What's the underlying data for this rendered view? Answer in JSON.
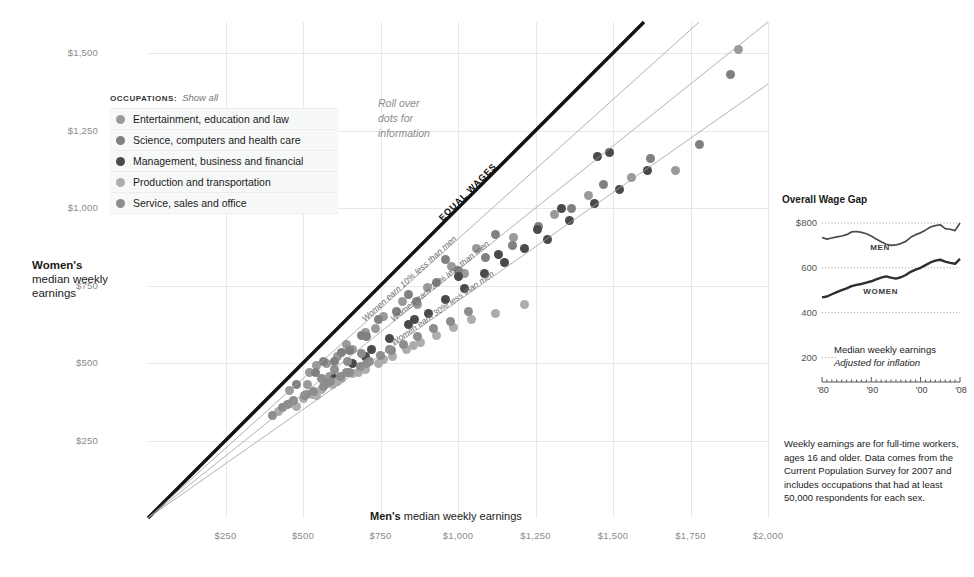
{
  "chart_data": {
    "type": "scatter",
    "title": "",
    "xlabel": "Men's median weekly earnings",
    "ylabel": "Women's median weekly earnings",
    "xlim": [
      0,
      2000
    ],
    "ylim": [
      0,
      1600
    ],
    "grid": true,
    "xticks": [
      "$250",
      "$500",
      "$750",
      "$1,000",
      "$1,250",
      "$1,500",
      "$1,750",
      "$2,000"
    ],
    "xtick_values": [
      250,
      500,
      750,
      1000,
      1250,
      1500,
      1750,
      2000
    ],
    "yticks": [
      "$1,500",
      "$1,250",
      "$1,000",
      "$750",
      "$500",
      "$250"
    ],
    "ytick_values": [
      1500,
      1250,
      1000,
      750,
      500,
      250
    ],
    "reference_lines": [
      {
        "label": "EQUAL WAGES",
        "ratio": 1.0,
        "style": "thick-black"
      },
      {
        "label": "Women earn 10% less than men",
        "ratio": 0.9,
        "style": "thin-gray"
      },
      {
        "label": "Women earn 20% less than men",
        "ratio": 0.8,
        "style": "thin-gray"
      },
      {
        "label": "Women earn 30% less than men",
        "ratio": 0.7,
        "style": "thin-gray"
      }
    ],
    "series": [
      {
        "name": "Entertainment, education and law",
        "color": "#9a9a9a",
        "points": [
          [
            455,
            412
          ],
          [
            520,
            470
          ],
          [
            545,
            492
          ],
          [
            575,
            500
          ],
          [
            610,
            520
          ],
          [
            640,
            560
          ],
          [
            700,
            600
          ],
          [
            760,
            650
          ],
          [
            820,
            700
          ],
          [
            900,
            745
          ],
          [
            980,
            812
          ],
          [
            1060,
            870
          ],
          [
            1180,
            905
          ],
          [
            1310,
            980
          ],
          [
            1420,
            1040
          ],
          [
            1560,
            1100
          ],
          [
            1700,
            1120
          ],
          [
            1905,
            1510
          ],
          [
            515,
            430
          ],
          [
            585,
            455
          ],
          [
            660,
            545
          ],
          [
            735,
            610
          ],
          [
            870,
            690
          ],
          [
            1020,
            790
          ]
        ]
      },
      {
        "name": "Science, computers and health care",
        "color": "#808080",
        "points": [
          [
            480,
            430
          ],
          [
            540,
            470
          ],
          [
            600,
            505
          ],
          [
            650,
            540
          ],
          [
            690,
            590
          ],
          [
            745,
            640
          ],
          [
            800,
            665
          ],
          [
            865,
            700
          ],
          [
            930,
            760
          ],
          [
            1000,
            800
          ],
          [
            1090,
            840
          ],
          [
            1175,
            880
          ],
          [
            1260,
            940
          ],
          [
            1365,
            1000
          ],
          [
            1470,
            1075
          ],
          [
            1620,
            1160
          ],
          [
            1780,
            1205
          ],
          [
            1880,
            1430
          ],
          [
            565,
            505
          ],
          [
            625,
            535
          ],
          [
            705,
            585
          ],
          [
            840,
            720
          ],
          [
            960,
            835
          ],
          [
            1120,
            915
          ]
        ]
      },
      {
        "name": "Management, business and financial",
        "color": "#4a4a4a",
        "points": [
          [
            600,
            450
          ],
          [
            660,
            500
          ],
          [
            720,
            545
          ],
          [
            780,
            580
          ],
          [
            840,
            625
          ],
          [
            905,
            660
          ],
          [
            960,
            705
          ],
          [
            1020,
            740
          ],
          [
            1085,
            790
          ],
          [
            1150,
            825
          ],
          [
            1215,
            870
          ],
          [
            1290,
            900
          ],
          [
            1360,
            960
          ],
          [
            1440,
            1015
          ],
          [
            1520,
            1060
          ],
          [
            1610,
            1120
          ],
          [
            1450,
            1165
          ],
          [
            1490,
            1180
          ],
          [
            700,
            520
          ],
          [
            860,
            640
          ],
          [
            1000,
            780
          ],
          [
            1130,
            850
          ],
          [
            1255,
            930
          ],
          [
            1335,
            1000
          ]
        ]
      },
      {
        "name": "Production and transportation",
        "color": "#adadad",
        "points": [
          [
            420,
            345
          ],
          [
            460,
            370
          ],
          [
            500,
            385
          ],
          [
            530,
            400
          ],
          [
            560,
            415
          ],
          [
            595,
            430
          ],
          [
            625,
            450
          ],
          [
            660,
            465
          ],
          [
            700,
            480
          ],
          [
            745,
            500
          ],
          [
            790,
            520
          ],
          [
            835,
            545
          ],
          [
            880,
            565
          ],
          [
            930,
            590
          ],
          [
            985,
            615
          ],
          [
            1045,
            640
          ],
          [
            1120,
            660
          ],
          [
            1215,
            690
          ],
          [
            480,
            360
          ],
          [
            545,
            395
          ],
          [
            610,
            440
          ],
          [
            680,
            470
          ],
          [
            760,
            510
          ],
          [
            855,
            555
          ]
        ]
      },
      {
        "name": "Service, sales and office",
        "color": "#8c8c8c",
        "points": [
          [
            400,
            330
          ],
          [
            435,
            355
          ],
          [
            470,
            380
          ],
          [
            505,
            395
          ],
          [
            535,
            408
          ],
          [
            565,
            425
          ],
          [
            590,
            440
          ],
          [
            620,
            455
          ],
          [
            650,
            470
          ],
          [
            685,
            490
          ],
          [
            715,
            505
          ],
          [
            750,
            525
          ],
          [
            785,
            540
          ],
          [
            825,
            560
          ],
          [
            870,
            585
          ],
          [
            920,
            610
          ],
          [
            975,
            635
          ],
          [
            1035,
            665
          ],
          [
            450,
            365
          ],
          [
            510,
            400
          ],
          [
            575,
            435
          ],
          [
            640,
            468
          ],
          [
            705,
            500
          ],
          [
            780,
            545
          ],
          [
            560,
            450
          ],
          [
            600,
            478
          ],
          [
            645,
            505
          ],
          [
            690,
            530
          ]
        ]
      }
    ]
  },
  "legend": {
    "header": "OCCUPATIONS:",
    "show_all": "Show all",
    "items": [
      {
        "label": "Entertainment, education and law",
        "color": "#9a9a9a"
      },
      {
        "label": "Science, computers and health care",
        "color": "#808080"
      },
      {
        "label": "Management, business and financial",
        "color": "#4a4a4a"
      },
      {
        "label": "Production and transportation",
        "color": "#adadad"
      },
      {
        "label": "Service, sales and office",
        "color": "#8c8c8c"
      }
    ]
  },
  "rollover_note": {
    "line1": "Roll over",
    "line2": "dots for",
    "line3": "information"
  },
  "axis_titles": {
    "x_bold": "Men's",
    "x_rest": " median weekly earnings",
    "y_bold": "Women's",
    "y_rest": "median weekly earnings"
  },
  "inset": {
    "title": "Overall Wage Gap",
    "note_line1": "Median weekly earnings",
    "note_line2": "Adjusted for inflation",
    "chart_data": {
      "type": "line",
      "title": "Overall Wage Gap",
      "ylabel": "",
      "xlabel": "",
      "ylim": [
        180,
        840
      ],
      "xlim": [
        1980,
        2008
      ],
      "grid": true,
      "yticks": [
        "$800",
        "600",
        "400",
        "200"
      ],
      "ytick_values": [
        800,
        600,
        400,
        200
      ],
      "xticks": [
        "'80",
        "'90",
        "'00",
        "'08"
      ],
      "xtick_values": [
        1980,
        1990,
        2000,
        2008
      ],
      "series": [
        {
          "name": "MEN",
          "color": "#4a4a4a",
          "x": [
            1980,
            1981,
            1982,
            1983,
            1984,
            1985,
            1986,
            1987,
            1988,
            1989,
            1990,
            1991,
            1992,
            1993,
            1994,
            1995,
            1996,
            1997,
            1998,
            1999,
            2000,
            2001,
            2002,
            2003,
            2004,
            2005,
            2006,
            2007,
            2008
          ],
          "values": [
            735,
            728,
            733,
            738,
            742,
            748,
            760,
            762,
            758,
            752,
            742,
            728,
            716,
            705,
            700,
            702,
            708,
            718,
            736,
            748,
            756,
            768,
            782,
            788,
            792,
            775,
            772,
            766,
            800
          ]
        },
        {
          "name": "WOMEN",
          "color": "#2e2e2e",
          "x": [
            1980,
            1981,
            1982,
            1983,
            1984,
            1985,
            1986,
            1987,
            1988,
            1989,
            1990,
            1991,
            1992,
            1993,
            1994,
            1995,
            1996,
            1997,
            1998,
            1999,
            2000,
            2001,
            2002,
            2003,
            2004,
            2005,
            2006,
            2007,
            2008
          ],
          "values": [
            468,
            472,
            482,
            492,
            500,
            508,
            518,
            524,
            528,
            534,
            540,
            548,
            556,
            562,
            556,
            552,
            558,
            568,
            582,
            592,
            600,
            612,
            624,
            632,
            636,
            628,
            622,
            618,
            640
          ]
        }
      ]
    }
  },
  "footnote": {
    "text": "Weekly earnings are for full-time workers, ages 16 and older. Data comes from the Current Population Survey for 2007 and includes occupations that had at least 50,000 respondents for each sex."
  }
}
